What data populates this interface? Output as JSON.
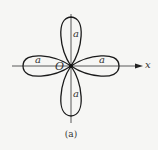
{
  "figure": {
    "caption": "(a)",
    "origin_label": "O",
    "x_axis_label": "x",
    "petal_labels": {
      "top": "a",
      "bottom": "a",
      "left": "a",
      "right": "a"
    },
    "stroke_color": "#1a1a1a",
    "background_color": "#f6f6f4"
  }
}
